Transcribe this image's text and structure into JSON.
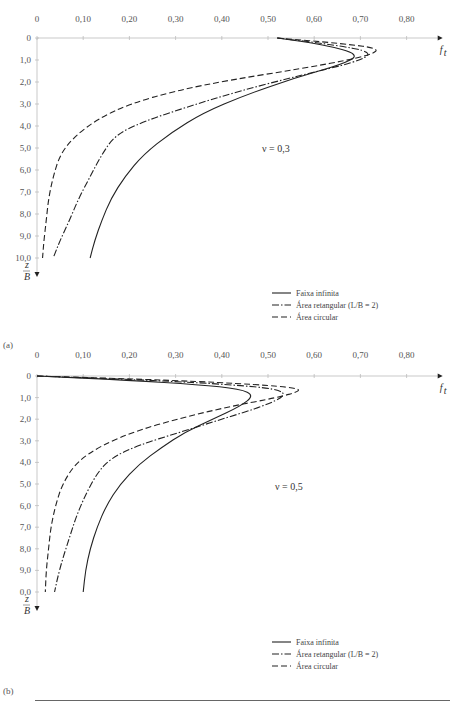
{
  "chart_data": [
    {
      "type": "line",
      "panel": "(a)",
      "annotation": "ν = 0,3",
      "xlabel": "f_t",
      "ylabel": "z/B",
      "x_ticks": [
        "0",
        "0,10",
        "0,20",
        "0,30",
        "0,40",
        "0,50",
        "0,60",
        "0,70",
        "0,80"
      ],
      "y_ticks": [
        "0",
        "1,0",
        "2,0",
        "3,0",
        "4,0",
        "5,0",
        "6,0",
        "7,0",
        "8,0",
        "9,0",
        "10,0"
      ],
      "xlim": [
        0,
        0.85
      ],
      "ylim": [
        0,
        10
      ],
      "x_axis_position": "top",
      "y_inverted": true,
      "legend_position": "lower right",
      "series": [
        {
          "name": "Faixa infinita",
          "style": "solid",
          "points": [
            [
              0.52,
              0
            ],
            [
              0.62,
              0.3
            ],
            [
              0.7,
              0.75
            ],
            [
              0.66,
              1.2
            ],
            [
              0.56,
              1.8
            ],
            [
              0.45,
              2.6
            ],
            [
              0.36,
              3.4
            ],
            [
              0.29,
              4.3
            ],
            [
              0.23,
              5.3
            ],
            [
              0.19,
              6.3
            ],
            [
              0.16,
              7.3
            ],
            [
              0.14,
              8.3
            ],
            [
              0.125,
              9.2
            ],
            [
              0.115,
              10.0
            ]
          ]
        },
        {
          "name": "Área retangular (L/B = 2)",
          "style": "dash-dot",
          "points": [
            [
              0.52,
              0
            ],
            [
              0.64,
              0.3
            ],
            [
              0.73,
              0.65
            ],
            [
              0.69,
              1.1
            ],
            [
              0.57,
              1.7
            ],
            [
              0.44,
              2.4
            ],
            [
              0.33,
              3.1
            ],
            [
              0.23,
              3.8
            ],
            [
              0.17,
              4.4
            ],
            [
              0.14,
              5.3
            ],
            [
              0.115,
              6.3
            ],
            [
              0.09,
              7.3
            ],
            [
              0.07,
              8.3
            ],
            [
              0.05,
              9.2
            ],
            [
              0.035,
              10.0
            ]
          ]
        },
        {
          "name": "Área circular",
          "style": "dashed",
          "points": [
            [
              0.52,
              0
            ],
            [
              0.66,
              0.25
            ],
            [
              0.75,
              0.5
            ],
            [
              0.7,
              0.9
            ],
            [
              0.57,
              1.4
            ],
            [
              0.42,
              1.9
            ],
            [
              0.3,
              2.4
            ],
            [
              0.2,
              3.0
            ],
            [
              0.13,
              3.7
            ],
            [
              0.08,
              4.5
            ],
            [
              0.05,
              5.3
            ],
            [
              0.035,
              6.3
            ],
            [
              0.025,
              7.3
            ],
            [
              0.02,
              8.3
            ],
            [
              0.015,
              9.2
            ],
            [
              0.012,
              10.0
            ]
          ]
        }
      ]
    },
    {
      "type": "line",
      "panel": "(b)",
      "annotation": "ν = 0,5",
      "xlabel": "f_t",
      "ylabel": "z/B",
      "x_ticks": [
        "0",
        "0,10",
        "0,20",
        "0,30",
        "0,40",
        "0,50",
        "0,60",
        "0,70",
        "0,80"
      ],
      "y_ticks": [
        "0",
        "1,0",
        "2,0",
        "3,0",
        "4,0",
        "5,0",
        "6,0",
        "7,0",
        "8,0",
        "9,0",
        "0,0"
      ],
      "xlim": [
        0,
        0.85
      ],
      "ylim": [
        0,
        10
      ],
      "x_axis_position": "top",
      "y_inverted": true,
      "legend_position": "lower right",
      "series": [
        {
          "name": "Faixa infinita",
          "style": "solid",
          "points": [
            [
              0,
              0
            ],
            [
              0.2,
              0.2
            ],
            [
              0.35,
              0.4
            ],
            [
              0.44,
              0.6
            ],
            [
              0.47,
              0.9
            ],
            [
              0.44,
              1.4
            ],
            [
              0.38,
              2.0
            ],
            [
              0.32,
              2.6
            ],
            [
              0.27,
              3.3
            ],
            [
              0.22,
              4.1
            ],
            [
              0.18,
              5.0
            ],
            [
              0.15,
              6.0
            ],
            [
              0.13,
              7.0
            ],
            [
              0.115,
              8.0
            ],
            [
              0.105,
              9.0
            ],
            [
              0.1,
              10.0
            ]
          ]
        },
        {
          "name": "Área retangular (L/B = 2)",
          "style": "dash-dot",
          "points": [
            [
              0,
              0
            ],
            [
              0.25,
              0.2
            ],
            [
              0.42,
              0.4
            ],
            [
              0.52,
              0.6
            ],
            [
              0.54,
              0.9
            ],
            [
              0.49,
              1.4
            ],
            [
              0.4,
              2.0
            ],
            [
              0.31,
              2.6
            ],
            [
              0.22,
              3.2
            ],
            [
              0.16,
              3.8
            ],
            [
              0.13,
              4.5
            ],
            [
              0.105,
              5.5
            ],
            [
              0.085,
              6.5
            ],
            [
              0.07,
              7.5
            ],
            [
              0.055,
              8.5
            ],
            [
              0.045,
              9.3
            ],
            [
              0.038,
              10.0
            ]
          ]
        },
        {
          "name": "Área circular",
          "style": "dashed",
          "points": [
            [
              0,
              0
            ],
            [
              0.3,
              0.2
            ],
            [
              0.48,
              0.4
            ],
            [
              0.56,
              0.55
            ],
            [
              0.57,
              0.7
            ],
            [
              0.52,
              1.0
            ],
            [
              0.42,
              1.4
            ],
            [
              0.32,
              1.9
            ],
            [
              0.22,
              2.5
            ],
            [
              0.14,
              3.2
            ],
            [
              0.085,
              4.0
            ],
            [
              0.055,
              5.0
            ],
            [
              0.04,
              6.0
            ],
            [
              0.03,
              7.0
            ],
            [
              0.025,
              8.0
            ],
            [
              0.02,
              9.0
            ],
            [
              0.018,
              10.0
            ]
          ]
        }
      ]
    }
  ]
}
